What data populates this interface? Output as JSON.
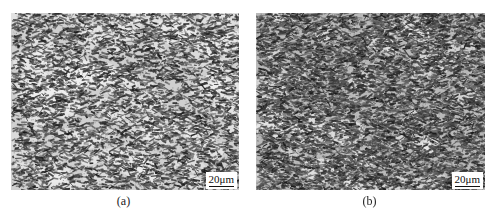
{
  "figure": {
    "panels": [
      {
        "id": "a",
        "caption": "(a)",
        "scale_bar": "20μm",
        "description": "Optical micrograph of microstructure, coarser light regions"
      },
      {
        "id": "b",
        "caption": "(b)",
        "scale_bar": "20μm",
        "description": "Optical micrograph of microstructure, finer denser dark phase"
      }
    ]
  }
}
